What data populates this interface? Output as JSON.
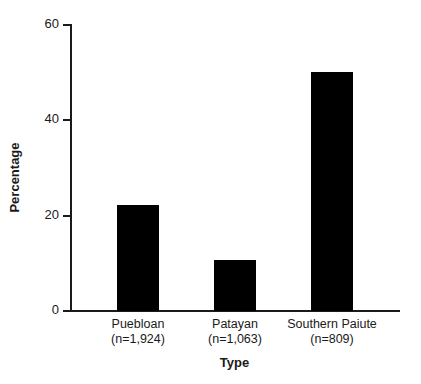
{
  "chart_data": {
    "type": "bar",
    "title": "",
    "subtitle": "",
    "xlabel": "Type",
    "ylabel": "Percentage",
    "categories": [
      "Puebloan",
      "Patayan",
      "Southern Paiute"
    ],
    "category_counts": [
      "(n=1,924)",
      "(n=1,063)",
      "(n=809)"
    ],
    "category_labels": [
      "Puebloan\n(n=1,924)",
      "Patayan\n(n=1,063)",
      "Southern Paiute\n(n=809)"
    ],
    "values": [
      22.2,
      10.7,
      50.0
    ],
    "ylim": [
      0,
      60
    ],
    "yticks": [
      0,
      20,
      40,
      60
    ],
    "ytick_labels": [
      "0",
      "20",
      "40",
      "60"
    ],
    "xticks": [],
    "grid": false,
    "legend": false,
    "legend_position": "none",
    "bar_color": "#000000",
    "axis_color": "#1a1a1a",
    "background_color": "#ffffff",
    "bar_width_px": 42,
    "annotations": []
  },
  "axis": {
    "y_label": "Percentage",
    "x_label": "Type",
    "y_ticks": [
      {
        "value": 60,
        "label": "60"
      },
      {
        "value": 40,
        "label": "40"
      },
      {
        "value": 20,
        "label": "20"
      },
      {
        "value": 0,
        "label": "0"
      }
    ]
  },
  "bars": [
    {
      "name": "Puebloan",
      "count_label": "(n=1,924)",
      "value": 22.2,
      "value_label": "22.2"
    },
    {
      "name": "Patayan",
      "count_label": "(n=1,063)",
      "value": 10.7,
      "value_label": "10.7"
    },
    {
      "name": "Southern Paiute",
      "count_label": "(n=809)",
      "value": 50.0,
      "value_label": "50.0"
    }
  ]
}
